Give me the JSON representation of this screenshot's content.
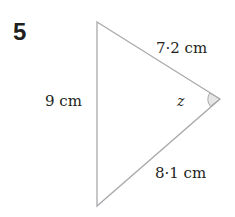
{
  "question": {
    "number": "5"
  },
  "diagram": {
    "type": "triangle",
    "vertices": {
      "top": [
        97,
        22
      ],
      "apex": [
        220,
        99
      ],
      "bottom": [
        97,
        206
      ]
    },
    "sides": {
      "left": "9 cm",
      "upper": "7·2 cm",
      "lower": "8·1 cm"
    },
    "angle": {
      "label": "z",
      "at": "apex",
      "fill": "#e6e6e6"
    },
    "colors": {
      "line": "#a7a9ac",
      "text": "#231f20"
    }
  }
}
